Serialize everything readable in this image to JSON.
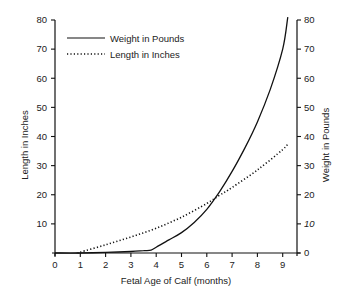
{
  "chart_data": {
    "type": "line",
    "title": "",
    "xlabel": "Fetal Age of Calf (months)",
    "ylabel_left": "Length in Inches",
    "ylabel_right": "Weight in Pounds",
    "xlim": [
      0,
      9.5
    ],
    "ylim_left": [
      0,
      80
    ],
    "ylim_right": [
      0,
      80
    ],
    "x_ticks": [
      "0",
      "1",
      "2",
      "3",
      "4",
      "5",
      "6",
      "7",
      "8",
      "9"
    ],
    "y_ticks_left": [
      "80",
      "70",
      "60",
      "50",
      "40",
      "30",
      "20",
      "10"
    ],
    "y_ticks_right": [
      "80",
      "70",
      "60",
      "50",
      "40",
      "30",
      "20",
      "10",
      "0"
    ],
    "grid": false,
    "legend_position": "upper-left",
    "series": [
      {
        "name": "Weight in Pounds",
        "axis": "right",
        "style": "solid",
        "x": [
          0,
          1,
          2,
          3,
          3.5,
          3.8,
          4,
          4.5,
          5,
          5.5,
          6,
          6.5,
          7,
          7.5,
          8,
          8.5,
          9,
          9.2
        ],
        "values": [
          0,
          0,
          0.2,
          0.5,
          0.8,
          1,
          2,
          4.5,
          7,
          10.5,
          15,
          21,
          28,
          36,
          45,
          56,
          70,
          81
        ]
      },
      {
        "name": "Length in Inches",
        "axis": "left",
        "style": "dotted",
        "x": [
          0.9,
          1,
          2,
          3,
          4,
          5,
          6,
          6.5,
          7,
          8,
          9,
          9.2
        ],
        "values": [
          0,
          0.3,
          2.8,
          5.5,
          8.5,
          12.3,
          17,
          19.8,
          22.5,
          28.5,
          35.5,
          37.5
        ]
      }
    ]
  },
  "legend": {
    "items": [
      {
        "label": "Weight in Pounds",
        "style": "solid"
      },
      {
        "label": "Length in Inches",
        "style": "dotted"
      }
    ]
  },
  "axes": {
    "x_title": "Fetal Age of Calf (months)",
    "left_title": "Length in Inches",
    "right_title": "Weight in Pounds",
    "x_ticks": [
      "0",
      "1",
      "2",
      "3",
      "4",
      "5",
      "6",
      "7",
      "8",
      "9"
    ],
    "left_ticks": [
      "80",
      "70",
      "60",
      "50",
      "40",
      "30",
      "20",
      "10"
    ],
    "right_ticks": [
      "80",
      "70",
      "60",
      "50",
      "40",
      "30",
      "20",
      "10",
      "0"
    ]
  },
  "colors": {
    "line": "#111111",
    "text": "#222222",
    "background": "#ffffff"
  }
}
